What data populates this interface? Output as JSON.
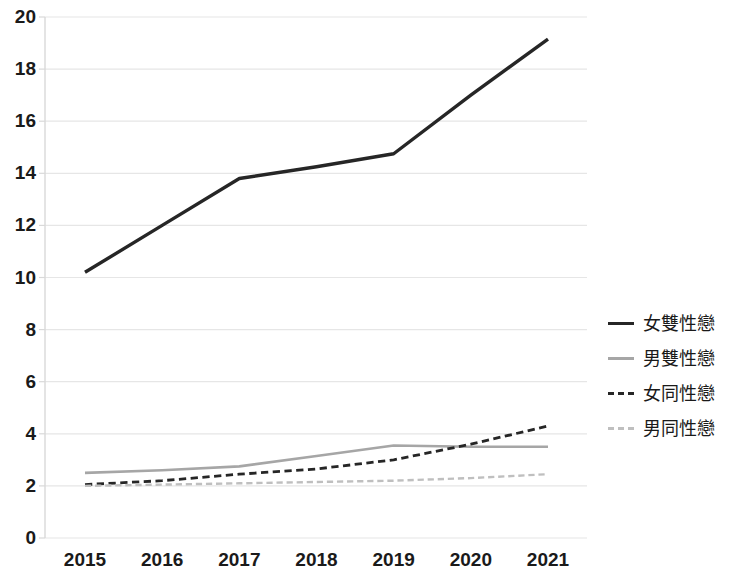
{
  "chart_data": {
    "type": "line",
    "title": "",
    "subtitle": "",
    "xlabel": "",
    "ylabel": "",
    "categories": [
      "2015",
      "2016",
      "2017",
      "2018",
      "2019",
      "2020",
      "2021"
    ],
    "x": [
      2015,
      2016,
      2017,
      2018,
      2019,
      2020,
      2021
    ],
    "xlim": [
      2015,
      2021
    ],
    "ylim": [
      0,
      20
    ],
    "yticks": [
      0,
      2,
      4,
      6,
      8,
      10,
      12,
      14,
      16,
      18,
      20
    ],
    "grid": true,
    "legend_position": "right",
    "series": [
      {
        "name": "女雙性戀",
        "style": "solid",
        "color": "#262626",
        "width": 3.4,
        "values": [
          10.2,
          12.0,
          13.8,
          14.25,
          14.75,
          17.0,
          19.15
        ]
      },
      {
        "name": "男雙性戀",
        "style": "solid",
        "color": "#a6a6a6",
        "width": 2.6,
        "values": [
          2.5,
          2.6,
          2.75,
          3.15,
          3.55,
          3.5,
          3.5
        ]
      },
      {
        "name": "女同性戀",
        "style": "dashed",
        "color": "#262626",
        "width": 2.8,
        "values": [
          2.05,
          2.2,
          2.45,
          2.65,
          3.0,
          3.6,
          4.3
        ]
      },
      {
        "name": "男同性戀",
        "style": "dashed",
        "color": "#bfbfbf",
        "width": 2.4,
        "values": [
          2.0,
          2.05,
          2.1,
          2.15,
          2.2,
          2.3,
          2.45
        ]
      }
    ]
  },
  "axes": {
    "y_tick_labels": [
      "20",
      "18",
      "16",
      "14",
      "12",
      "10",
      "8",
      "6",
      "4",
      "2",
      "0"
    ],
    "x_tick_labels": [
      "2015",
      "2016",
      "2017",
      "2018",
      "2019",
      "2020",
      "2021"
    ]
  },
  "legend": {
    "items": [
      {
        "label": "女雙性戀",
        "marker": "solid-dark"
      },
      {
        "label": "男雙性戀",
        "marker": "solid-gray"
      },
      {
        "label": "女同性戀",
        "marker": "dash-dark"
      },
      {
        "label": "男同性戀",
        "marker": "dash-gray"
      }
    ]
  },
  "colors": {
    "gridline": "#e6e6e6",
    "axis": "#d9d9d9",
    "text": "#1a1a1a",
    "dark_series": "#262626",
    "gray_series": "#a6a6a6",
    "light_gray_series": "#bfbfbf",
    "background": "#ffffff"
  }
}
